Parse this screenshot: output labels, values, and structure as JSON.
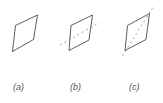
{
  "figures": [
    {
      "label": "(a)",
      "annotation": "none"
    },
    {
      "label": "(b)",
      "annotation": "dashed line through midpoints of left and right sides"
    },
    {
      "label": "(c)",
      "annotation": "dashed diagonal from bottom-left to top-right corner"
    }
  ],
  "colors": {
    "stroke": "#333333",
    "dash": "#777777",
    "label": "#555555"
  }
}
